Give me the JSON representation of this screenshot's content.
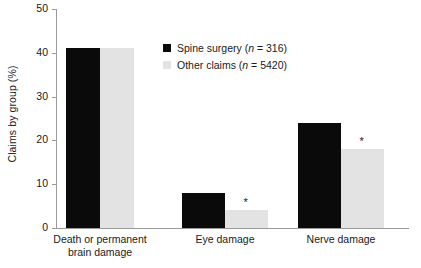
{
  "chart_data": {
    "type": "bar",
    "title": "",
    "xlabel": "",
    "ylabel": "Claims by group (%)",
    "ylim": [
      0,
      50
    ],
    "yticks": [
      0,
      10,
      20,
      30,
      40,
      50
    ],
    "ytick_labels": [
      "0",
      "10",
      "20",
      "30",
      "40",
      "50"
    ],
    "grid": false,
    "legend_position": "upper center",
    "categories": [
      "Death or permanent brain damage",
      "Eye damage",
      "Nerve damage"
    ],
    "category_lines": [
      [
        "Death or permanent",
        "brain damage"
      ],
      [
        "Eye damage",
        ""
      ],
      [
        "Nerve damage",
        ""
      ]
    ],
    "series": [
      {
        "name": "Spine surgery (n = 316)",
        "name_prefix": "Spine surgery (",
        "name_italic": "n",
        "name_suffix": " = 316)",
        "color": "#0a0a0a",
        "values": [
          41,
          8,
          24
        ]
      },
      {
        "name": "Other claims (n = 5420)",
        "name_prefix": "Other claims (",
        "name_italic": "n",
        "name_suffix": " = 5420)",
        "color": "#e3e3e3",
        "values": [
          41,
          4,
          18
        ]
      }
    ],
    "annotations": [
      {
        "text": "*",
        "category": "Eye damage",
        "series": "Other claims (n = 5420)",
        "value": 4
      },
      {
        "text": "*",
        "category": "Nerve damage",
        "series": "Other claims (n = 5420)",
        "value": 18
      }
    ],
    "axis_color": "#9a9a9a"
  }
}
